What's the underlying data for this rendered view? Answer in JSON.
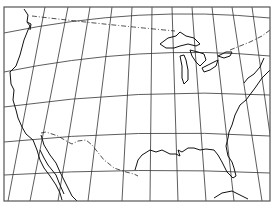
{
  "map": {
    "title": "",
    "region": "United States outline with graticule",
    "features": [
      "graticule",
      "coastline",
      "great-lakes",
      "international-borders",
      "florida",
      "baja-california",
      "cuba-partial"
    ],
    "colors": {
      "background": "#ffffff",
      "line": "#111111",
      "frame": "#555555"
    }
  }
}
